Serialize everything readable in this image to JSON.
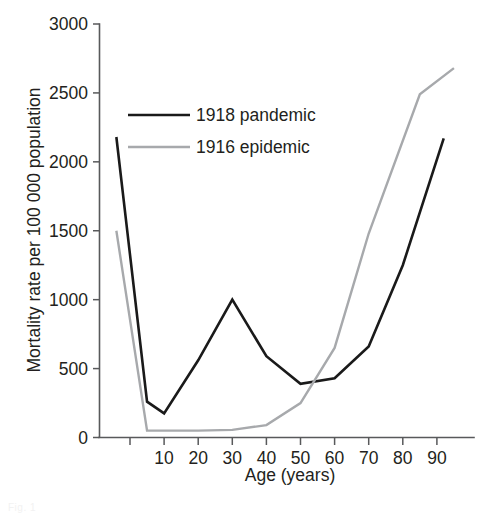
{
  "chart_data": {
    "type": "line",
    "title": "",
    "subtitle": "",
    "xlabel": "Age (years)",
    "ylabel": "Mortality rate per 100 000 population",
    "xlim": [
      -5,
      95
    ],
    "ylim": [
      0,
      3000
    ],
    "grid": false,
    "legend_position": "upper-left-inside",
    "x_ticks": [
      0,
      10,
      20,
      30,
      40,
      50,
      60,
      70,
      80,
      90
    ],
    "x_tick_labels": [
      "",
      "10",
      "20",
      "30",
      "40",
      "50",
      "60",
      "70",
      "80",
      "90"
    ],
    "y_ticks": [
      0,
      500,
      1000,
      1500,
      2000,
      2500,
      3000
    ],
    "y_tick_labels": [
      "0",
      "500",
      "1000",
      "1500",
      "2000",
      "2500",
      "3000"
    ],
    "series": [
      {
        "name": "1918 pandemic",
        "color": "#1a1a1a",
        "line_width": 2.6,
        "x": [
          -4,
          5,
          10,
          20,
          30,
          40,
          50,
          60,
          70,
          80,
          92
        ],
        "values": [
          2180,
          260,
          175,
          560,
          1000,
          590,
          390,
          430,
          660,
          1250,
          2170
        ]
      },
      {
        "name": "1916 epidemic",
        "color": "#a7a9ac",
        "line_width": 2.4,
        "x": [
          -4,
          5,
          10,
          20,
          30,
          40,
          50,
          60,
          70,
          85,
          95
        ],
        "values": [
          1500,
          50,
          50,
          50,
          55,
          90,
          250,
          650,
          1480,
          2490,
          2680
        ]
      }
    ]
  },
  "legend": {
    "items": [
      {
        "label": "1918 pandemic",
        "color": "#1a1a1a"
      },
      {
        "label": "1916 epidemic",
        "color": "#a7a9ac"
      }
    ]
  },
  "caption": {
    "sliver_text": "Fig. 1"
  }
}
